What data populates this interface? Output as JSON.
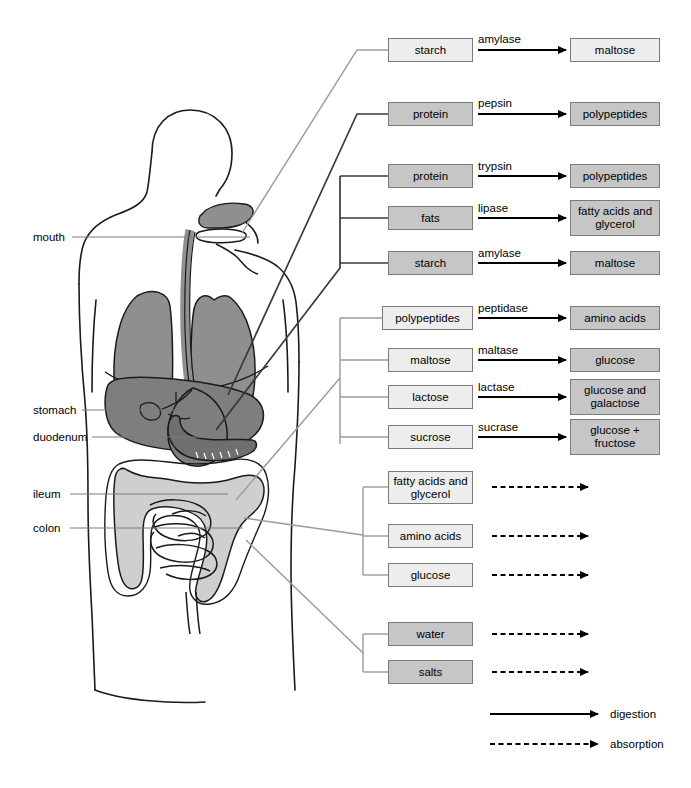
{
  "anatomy_labels": [
    {
      "id": "mouth",
      "text": "mouth",
      "x": 33,
      "y": 232,
      "line_x1": 72,
      "line_x2": 250,
      "line_y": 237
    },
    {
      "id": "stomach",
      "text": "stomach",
      "x": 33,
      "y": 405,
      "line_x1": 82,
      "line_x2": 215,
      "line_y": 410
    },
    {
      "id": "duomenum",
      "text": "duodenum",
      "x": 33,
      "y": 432,
      "line_x1": 92,
      "line_x2": 208,
      "line_y": 437
    },
    {
      "id": "ileum",
      "text": "ileum",
      "x": 33,
      "y": 489,
      "line_x1": 70,
      "line_x2": 228,
      "line_y": 494
    },
    {
      "id": "colon",
      "text": "colon",
      "x": 33,
      "y": 523,
      "line_x1": 70,
      "line_x2": 243,
      "line_y": 528
    }
  ],
  "groups": [
    {
      "id": "mouth-group",
      "site": "mouth",
      "connector": {
        "from_x": 242,
        "from_y": 233,
        "elbow_x": 363,
        "elbow_y": 50,
        "shade": "light"
      },
      "rows": [
        {
          "substrate": "starch",
          "substrate_shade": "light",
          "enzyme": "amylase",
          "product": "maltose",
          "product_shade": "light",
          "arrow": "digestion",
          "y": 38,
          "h": 24,
          "product_h": 24
        }
      ]
    },
    {
      "id": "stomach-group",
      "site": "stomach",
      "connector": {
        "from_x": 230,
        "from_y": 395,
        "elbow_x": 363,
        "elbow_y": 114,
        "shade": "dark"
      },
      "rows": [
        {
          "substrate": "protein",
          "substrate_shade": "mid",
          "enzyme": "pepsin",
          "product": "polypeptides",
          "product_shade": "mid",
          "arrow": "digestion",
          "y": 101,
          "h": 24,
          "product_h": 24
        }
      ]
    },
    {
      "id": "duodenum-group",
      "site": "duodenum",
      "connector": {
        "from_x": 218,
        "from_y": 430,
        "elbow_x": 340,
        "elbow_y": 268,
        "shade": "dark"
      },
      "bracket": {
        "x": 340,
        "top": 176,
        "bottom": 268,
        "shade": "dark"
      },
      "rows": [
        {
          "substrate": "protein",
          "substrate_shade": "mid",
          "enzyme": "trypsin",
          "product": "polypeptides",
          "product_shade": "mid",
          "arrow": "digestion",
          "y": 164,
          "h": 24,
          "product_h": 24
        },
        {
          "substrate": "fats",
          "substrate_shade": "mid",
          "enzyme": "lipase",
          "product": "fatty acids and glycerol",
          "product_shade": "mid",
          "arrow": "digestion",
          "y": 206,
          "h": 24,
          "product_h": 38
        },
        {
          "substrate": "starch",
          "substrate_shade": "mid",
          "enzyme": "amylase",
          "product": "maltose",
          "product_shade": "mid",
          "arrow": "digestion",
          "y": 251,
          "h": 24,
          "product_h": 24
        }
      ]
    },
    {
      "id": "ileum-digestion-group",
      "site": "ileum",
      "connector": {
        "from_x": 240,
        "from_y": 497,
        "elbow_x": 340,
        "elbow_y": 378,
        "shade": "light"
      },
      "bracket": {
        "x": 340,
        "top": 318,
        "bottom": 444,
        "shade": "light"
      },
      "rows": [
        {
          "substrate": "polypeptides",
          "substrate_shade": "light",
          "enzyme": "peptidase",
          "product": "amino acids",
          "product_shade": "mid",
          "arrow": "digestion",
          "y": 306,
          "h": 24,
          "product_h": 24
        },
        {
          "substrate": "maltose",
          "substrate_shade": "light",
          "enzyme": "maltase",
          "product": "glucose",
          "product_shade": "mid",
          "arrow": "digestion",
          "y": 348,
          "h": 24,
          "product_h": 24
        },
        {
          "substrate": "lactose",
          "substrate_shade": "light",
          "enzyme": "lactase",
          "product": "glucose and galactose",
          "product_shade": "mid",
          "arrow": "digestion",
          "y": 385,
          "h": 24,
          "product_h": 38
        },
        {
          "substrate": "sucrose",
          "substrate_shade": "light",
          "enzyme": "sucrase",
          "product": "glucose + fructose",
          "product_shade": "mid",
          "arrow": "digestion",
          "y": 425,
          "h": 24,
          "product_h": 38
        }
      ]
    },
    {
      "id": "ileum-absorption-group",
      "site": "ileum",
      "connector": {
        "from_x": 247,
        "from_y": 516,
        "elbow_x": 363,
        "elbow_y": 535,
        "shade": "light"
      },
      "bracket": {
        "x": 363,
        "top": 487,
        "bottom": 575,
        "shade": "light"
      },
      "rows": [
        {
          "substrate": "fatty acids and glycerol",
          "substrate_shade": "light",
          "enzyme": "",
          "product": "",
          "arrow": "absorption",
          "y": 473,
          "h": 38
        },
        {
          "substrate": "amino acids",
          "substrate_shade": "light",
          "enzyme": "",
          "product": "",
          "arrow": "absorption",
          "y": 524,
          "h": 24
        },
        {
          "substrate": "glucose",
          "substrate_shade": "light",
          "enzyme": "",
          "product": "",
          "arrow": "absorption",
          "y": 563,
          "h": 24
        }
      ]
    },
    {
      "id": "colon-group",
      "site": "colon",
      "connector": {
        "from_x": 248,
        "from_y": 540,
        "elbow_x": 363,
        "elbow_y": 653,
        "shade": "light"
      },
      "bracket": {
        "x": 363,
        "top": 634,
        "bottom": 672,
        "shade": "light"
      },
      "rows": [
        {
          "substrate": "water",
          "substrate_shade": "mid",
          "enzyme": "",
          "product": "",
          "arrow": "absorption",
          "y": 622,
          "h": 24
        },
        {
          "substrate": "salts",
          "substrate_shade": "mid",
          "enzyme": "",
          "product": "",
          "arrow": "absorption",
          "y": 660,
          "h": 24
        }
      ]
    }
  ],
  "legend": {
    "items": [
      {
        "id": "digestion",
        "label": "digestion",
        "style": "solid",
        "y": 714
      },
      {
        "id": "absorption",
        "label": "absorption",
        "style": "dashed",
        "y": 744
      }
    ],
    "arrow_x1": 490,
    "arrow_x2": 600,
    "label_x": 610
  },
  "colors": {
    "box_border": "#7b7b7b",
    "box_light": "#ededed",
    "box_mid": "#c6c6c6",
    "arrow": "#000000",
    "connector_light": "#9a9a9a",
    "connector_dark": "#3a3a3a",
    "organ_dark": "#8c8c8c",
    "organ_mid": "#a8a8a8",
    "organ_light": "#cfcfcf",
    "outline": "#1a1a1a"
  },
  "layout": {
    "substrate_box_x": 388,
    "substrate_box_w": 85,
    "product_box_x": 570,
    "product_box_w": 90,
    "arrow_x1": 478,
    "arrow_x2": 566,
    "enzyme_x": 478
  }
}
